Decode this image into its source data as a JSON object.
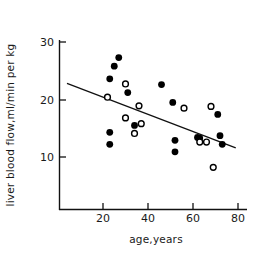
{
  "chart_data": {
    "type": "scatter",
    "title": "",
    "xlabel": "age,years",
    "ylabel": "liver blood flow,ml/min per kg",
    "xlim": [
      0,
      85
    ],
    "ylim": [
      5,
      32
    ],
    "xticks": [
      20,
      40,
      60,
      80
    ],
    "xtick_labels": [
      "20",
      "40",
      "60",
      "80"
    ],
    "yticks": [
      10,
      20,
      30
    ],
    "ytick_labels": [
      "10",
      "20",
      "30"
    ],
    "grid": false,
    "legend": false,
    "legend_position": "none",
    "series": [
      {
        "name": "filled-circles",
        "marker": "filled-circle",
        "color": "#000000",
        "points": [
          {
            "x": 23,
            "y": 23.6
          },
          {
            "x": 23,
            "y": 14.3
          },
          {
            "x": 23,
            "y": 12.2
          },
          {
            "x": 25,
            "y": 25.8
          },
          {
            "x": 27,
            "y": 27.3
          },
          {
            "x": 31,
            "y": 21.2
          },
          {
            "x": 34,
            "y": 15.5
          },
          {
            "x": 46,
            "y": 22.6
          },
          {
            "x": 51,
            "y": 19.5
          },
          {
            "x": 52,
            "y": 12.9
          },
          {
            "x": 52,
            "y": 10.9
          },
          {
            "x": 62,
            "y": 13.4
          },
          {
            "x": 63,
            "y": 13.3
          },
          {
            "x": 71,
            "y": 17.4
          },
          {
            "x": 72,
            "y": 13.7
          },
          {
            "x": 73,
            "y": 12.2
          }
        ]
      },
      {
        "name": "open-circles",
        "marker": "open-circle",
        "color": "#000000",
        "points": [
          {
            "x": 22,
            "y": 20.4
          },
          {
            "x": 30,
            "y": 22.7
          },
          {
            "x": 30,
            "y": 16.8
          },
          {
            "x": 34,
            "y": 14.1
          },
          {
            "x": 36,
            "y": 18.9
          },
          {
            "x": 37,
            "y": 15.8
          },
          {
            "x": 56,
            "y": 18.5
          },
          {
            "x": 63,
            "y": 12.6
          },
          {
            "x": 66,
            "y": 12.6
          },
          {
            "x": 68,
            "y": 18.8
          },
          {
            "x": 69,
            "y": 8.2
          }
        ]
      }
    ],
    "fit_line": {
      "name": "regression-line",
      "x_start": 4,
      "y_start": 22.8,
      "x_end": 79,
      "y_end": 11.6
    }
  }
}
